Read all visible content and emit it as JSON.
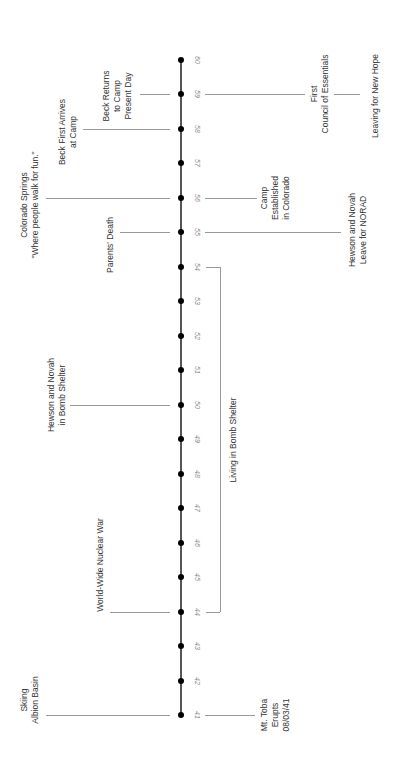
{
  "timeline": {
    "ticks": [
      "41",
      "42",
      "43",
      "44",
      "45",
      "46",
      "47",
      "48",
      "49",
      "50",
      "51",
      "52",
      "53",
      "54",
      "55",
      "56",
      "57",
      "58",
      "59",
      "60"
    ],
    "events_left": [
      {
        "label": "Skiing\nAlbion Basin",
        "tick": "41"
      },
      {
        "label": "World-Wide Nuclear War",
        "tick": "44"
      },
      {
        "label": "Hewson and Novah\nin Bomb Shelter",
        "tick": "50"
      },
      {
        "label": "Parents' Death",
        "tick": "55"
      },
      {
        "label": "Colorado Springs\n\"Where people walk for fun.\"",
        "tick": "56"
      },
      {
        "label": "Beck First Arrives\nat Camp",
        "tick": "58"
      },
      {
        "label": "Beck Returns\nto Camp\nPresent Day",
        "tick": "59"
      }
    ],
    "events_right": [
      {
        "label": "Mt. Toba\nErupts\n08/03/41",
        "tick": "41"
      },
      {
        "label": "Living in Bomb Shelter",
        "range": [
          "44",
          "54"
        ]
      },
      {
        "label": "Hewson and Novah\nLeave for NORAD",
        "tick": "55"
      },
      {
        "label": "Camp\nEstablished\nin Colorado",
        "tick": "56"
      },
      {
        "label": "First\nCouncil of Essentials",
        "tick": "59"
      },
      {
        "label": "Leaving for New Hope",
        "tick": "59"
      }
    ]
  }
}
